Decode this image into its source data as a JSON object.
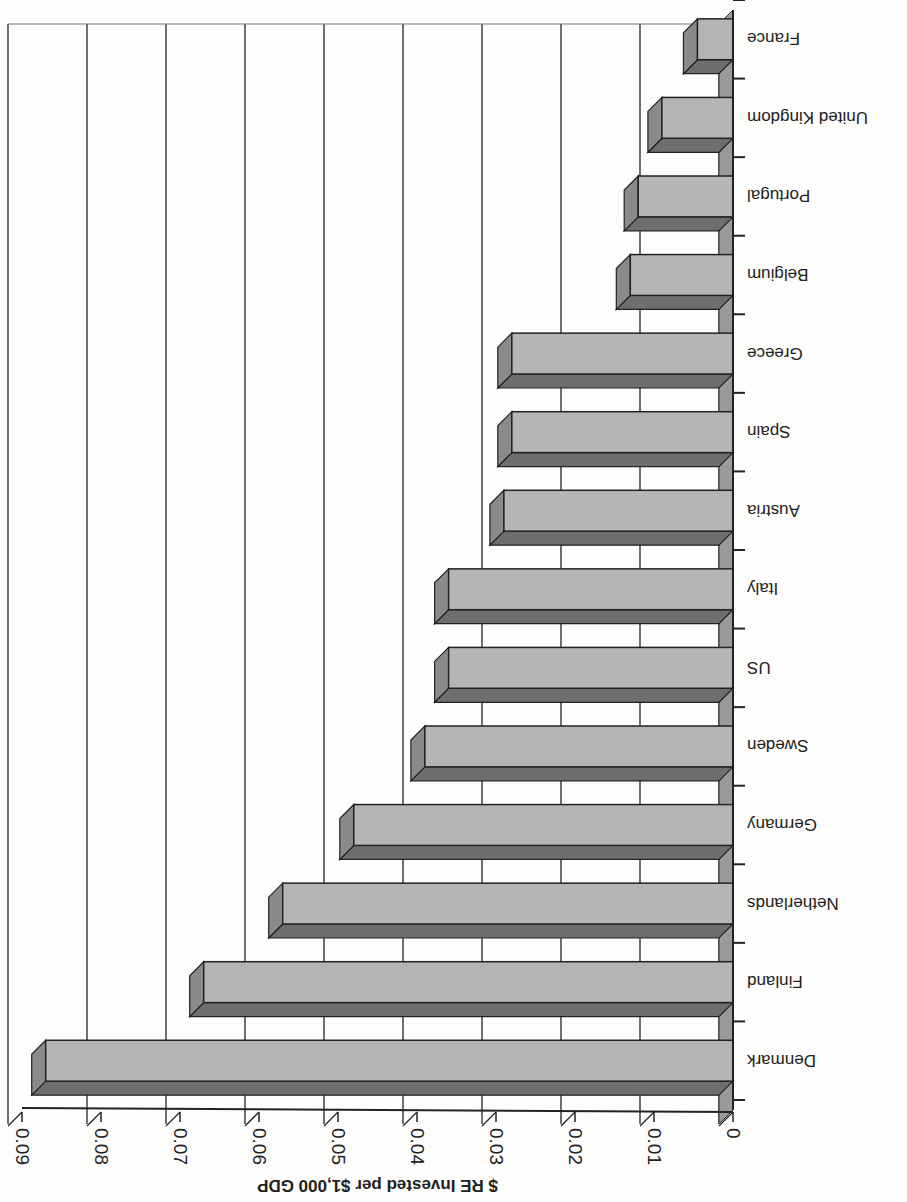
{
  "chart_data": {
    "type": "bar",
    "orientation": "horizontal",
    "rendering": "3d-bar, image rotated 180 degrees",
    "title": "",
    "xlabel": "$ RE Invested per $1,000 GDP",
    "ylabel": "",
    "xlim": [
      0,
      0.09
    ],
    "x_ticks": [
      "0",
      "0.01",
      "0.02",
      "0.03",
      "0.04",
      "0.05",
      "0.06",
      "0.07",
      "0.08",
      "0.09"
    ],
    "grid": true,
    "legend": null,
    "categories": [
      "Denmark",
      "Finland",
      "Netherlands",
      "Germany",
      "Sweden",
      "US",
      "Italy",
      "Austria",
      "Spain",
      "Greece",
      "Belgium",
      "Portugal",
      "United Kingdom",
      "France"
    ],
    "values": [
      0.087,
      0.067,
      0.057,
      0.048,
      0.039,
      0.036,
      0.036,
      0.029,
      0.028,
      0.028,
      0.013,
      0.012,
      0.009,
      0.0045
    ],
    "colors": {
      "bar_front": "#b5b5b5",
      "bar_top": "#6e6e6e",
      "bar_side": "#8a8a8a",
      "wall": "#9a9a9a",
      "grid": "#222222"
    }
  },
  "axis": {
    "title": "$ RE Invested per $1,000 GDP",
    "ticks": [
      "0",
      "0.01",
      "0.02",
      "0.03",
      "0.04",
      "0.05",
      "0.06",
      "0.07",
      "0.08",
      "0.09"
    ]
  },
  "labels": [
    "Denmark",
    "Finland",
    "Netherlands",
    "Germany",
    "Sweden",
    "US",
    "Italy",
    "Austria",
    "Spain",
    "Greece",
    "Belgium",
    "Portugal",
    "United Kingdom",
    "France"
  ]
}
